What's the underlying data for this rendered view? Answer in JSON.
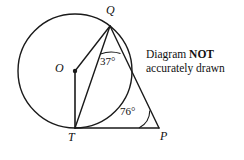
{
  "figure": {
    "type": "circle-geometry-diagram",
    "stroke_color": "#1a1a1a",
    "background_color": "#ffffff",
    "circle": {
      "cx": 75,
      "cy": 71,
      "r": 57
    },
    "points": {
      "O": {
        "x": 75,
        "y": 71,
        "label": "O",
        "label_x": 57,
        "label_y": 63,
        "marker": "filled-dot"
      },
      "Q": {
        "x": 110,
        "y": 26,
        "label": "Q",
        "label_x": 107,
        "label_y": 6,
        "marker": "none"
      },
      "T": {
        "x": 75,
        "y": 128,
        "label": "T",
        "label_x": 69,
        "label_y": 133,
        "marker": "none"
      },
      "P": {
        "x": 159,
        "y": 128,
        "label": "P",
        "label_x": 160,
        "label_y": 132,
        "marker": "none"
      },
      "X": {
        "x": 135,
        "y": 88,
        "label": "",
        "marker": "none"
      }
    },
    "segments": [
      {
        "name": "OQ",
        "from": "O",
        "to": "Q"
      },
      {
        "name": "OT",
        "from": "O",
        "to": "T"
      },
      {
        "name": "QT",
        "from": "Q",
        "to": "T"
      },
      {
        "name": "QP",
        "from": "Q",
        "to": "P"
      },
      {
        "name": "TP",
        "from": "T",
        "to": "P"
      }
    ],
    "angles": [
      {
        "name": "angle-at-Q",
        "vertex": "Q",
        "value": "37°",
        "label_x": 105,
        "label_y": 57,
        "arc": true
      },
      {
        "name": "angle-at-P",
        "vertex": "P",
        "value": "76°",
        "label_x": 123,
        "label_y": 108,
        "arc": true
      }
    ]
  },
  "note": {
    "line1_prefix": "Diagram ",
    "line1_emphasis": "NOT",
    "line2": "accurately drawn"
  }
}
